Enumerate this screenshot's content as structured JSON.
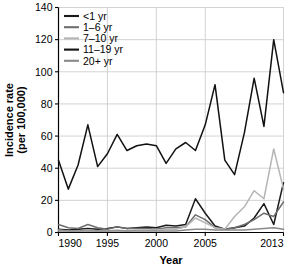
{
  "chart_data": {
    "type": "line",
    "title": "",
    "xlabel": "Year",
    "ylabel": "Incidence rate (per 100,000)",
    "ylabel_line1": "Incidence rate",
    "ylabel_line2": "(per 100,000)",
    "xlim": [
      1990,
      2013
    ],
    "ylim": [
      0,
      140
    ],
    "ytick_values": [
      0,
      20,
      40,
      60,
      80,
      100,
      120,
      140
    ],
    "ytick_labels": [
      "0",
      "20",
      "40",
      "60",
      "80",
      "100",
      "120",
      "140"
    ],
    "xtick_values": [
      1990,
      1995,
      2000,
      2005,
      2013
    ],
    "xtick_labels": [
      "1990",
      "1995",
      "2000",
      "2005",
      "2013"
    ],
    "grid": true,
    "legend_position": "top-left",
    "x": [
      1990,
      1991,
      1992,
      1993,
      1994,
      1995,
      1996,
      1997,
      1998,
      1999,
      2000,
      2001,
      2002,
      2003,
      2004,
      2005,
      2006,
      2007,
      2008,
      2009,
      2010,
      2011,
      2012,
      2013
    ],
    "series": [
      {
        "name": "<1 yr",
        "color": "#1a1a1a",
        "values": [
          2.0,
          1.5,
          2.0,
          2.5,
          2.0,
          2.5,
          3.5,
          2.5,
          3.0,
          3.5,
          3.0,
          4.5,
          4.0,
          5.0,
          21.0,
          12.0,
          4.0,
          2.0,
          3.0,
          4.0,
          9.0,
          18.0,
          5.0,
          31.0
        ]
      },
      {
        "name": "1–6 yr",
        "color": "#6e6e6e",
        "values": [
          5.0,
          3.0,
          2.5,
          5.0,
          3.0,
          2.0,
          3.5,
          2.5,
          2.5,
          2.5,
          2.0,
          3.0,
          3.0,
          3.5,
          11.0,
          8.0,
          3.0,
          2.0,
          3.0,
          5.0,
          8.0,
          12.0,
          10.0,
          19.0
        ]
      },
      {
        "name": "7–10 yr",
        "color": "#b5b5b5",
        "values": [
          1.5,
          1.0,
          1.0,
          1.5,
          1.0,
          1.0,
          1.5,
          1.0,
          1.5,
          1.5,
          1.5,
          2.0,
          2.0,
          3.5,
          9.0,
          6.0,
          3.0,
          2.0,
          10.0,
          16.0,
          26.0,
          21.0,
          52.0,
          27.0
        ]
      },
      {
        "name": "11–19 yr",
        "color": "#111111",
        "values": [
          45.0,
          27.0,
          42.0,
          67.0,
          41.0,
          49.0,
          61.0,
          51.0,
          54.0,
          55.0,
          54.0,
          43.0,
          52.0,
          56.0,
          51.0,
          67.0,
          92.0,
          45.0,
          36.0,
          62.0,
          96.0,
          66.0,
          120.0,
          87.0
        ]
      },
      {
        "name": "20+ yr",
        "color": "#8a8a8a",
        "values": [
          1.0,
          1.0,
          1.0,
          1.0,
          1.0,
          1.0,
          1.0,
          1.0,
          1.0,
          1.0,
          1.0,
          1.0,
          1.0,
          1.5,
          2.0,
          2.0,
          1.5,
          1.5,
          1.5,
          1.5,
          2.0,
          2.5,
          3.0,
          2.0
        ]
      }
    ]
  }
}
